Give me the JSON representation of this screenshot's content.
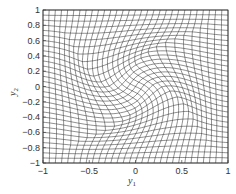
{
  "chart_data": {
    "type": "line",
    "title": "",
    "xlabel": "y",
    "xlabel_sub": "1",
    "ylabel": "y",
    "ylabel_sub": "2",
    "xlim": [
      -1,
      1
    ],
    "ylim": [
      -1,
      1
    ],
    "xticks": [
      -1,
      -0.5,
      0,
      0.5,
      1
    ],
    "xtick_labels": [
      "−1",
      "−0.5",
      "0",
      "0.5",
      "1"
    ],
    "yticks": [
      1,
      0.8,
      0.6,
      0.4,
      0.2,
      0,
      -0.2,
      -0.4,
      -0.6,
      -0.8,
      -1
    ],
    "ytick_labels": [
      "1",
      "0.8",
      "0.6",
      "0.4",
      "0.2",
      "0",
      "−0.2",
      "−0.4",
      "−0.6",
      "−0.8",
      "−1"
    ],
    "grid": {
      "description": "Deformed (swirl-warped) rectilinear mesh",
      "lines_per_axis": 31,
      "deformation": "swirl",
      "swirl_strength": 1.1,
      "swirl_radius": 0.75
    },
    "line_color": "#333333",
    "legend": null
  }
}
